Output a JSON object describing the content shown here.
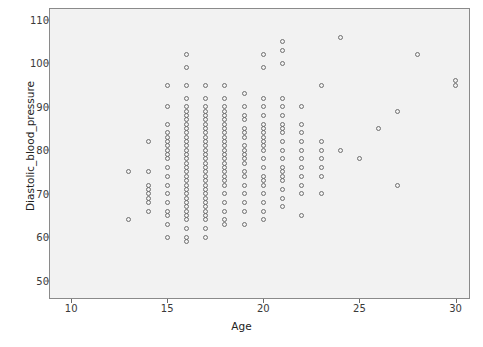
{
  "figure": {
    "clipped_header_text": "",
    "plot_area": {
      "x": 49,
      "y": 8,
      "width": 421,
      "height": 291
    },
    "colors": {
      "plot_background": "#f2f2f2",
      "frame": "#8a8a8a",
      "marker_stroke": "#6f6f6f",
      "tick": "#6a6a6a",
      "text": "#222222",
      "page_background": "#ffffff"
    }
  },
  "chart_data": {
    "type": "scatter",
    "title": "",
    "xlabel": "Age",
    "ylabel": "Diastolic_blood_pressure",
    "xlim": [
      8.9,
      30.7
    ],
    "ylim": [
      46.0,
      112.5
    ],
    "xticks": [
      10,
      15,
      20,
      25,
      30
    ],
    "yticks": [
      50,
      60,
      70,
      80,
      90,
      100,
      110
    ],
    "grid": false,
    "legend": null,
    "marker": {
      "shape": "circle-open",
      "size_px": 5
    },
    "points": [
      [
        13,
        75
      ],
      [
        13,
        64
      ],
      [
        14,
        82
      ],
      [
        14,
        75
      ],
      [
        14,
        72
      ],
      [
        14,
        71
      ],
      [
        14,
        70
      ],
      [
        14,
        69
      ],
      [
        14,
        68
      ],
      [
        14,
        66
      ],
      [
        15,
        95
      ],
      [
        15,
        90
      ],
      [
        15,
        86
      ],
      [
        15,
        84
      ],
      [
        15,
        83
      ],
      [
        15,
        82
      ],
      [
        15,
        81
      ],
      [
        15,
        80
      ],
      [
        15,
        79
      ],
      [
        15,
        78
      ],
      [
        15,
        76
      ],
      [
        15,
        74
      ],
      [
        15,
        72
      ],
      [
        15,
        70
      ],
      [
        15,
        68
      ],
      [
        15,
        66
      ],
      [
        15,
        65
      ],
      [
        15,
        63
      ],
      [
        15,
        60
      ],
      [
        16,
        102
      ],
      [
        16,
        99
      ],
      [
        16,
        95
      ],
      [
        16,
        92
      ],
      [
        16,
        90
      ],
      [
        16,
        89
      ],
      [
        16,
        88
      ],
      [
        16,
        87
      ],
      [
        16,
        86
      ],
      [
        16,
        85
      ],
      [
        16,
        84
      ],
      [
        16,
        83
      ],
      [
        16,
        82
      ],
      [
        16,
        81
      ],
      [
        16,
        80
      ],
      [
        16,
        79
      ],
      [
        16,
        78
      ],
      [
        16,
        77
      ],
      [
        16,
        76
      ],
      [
        16,
        75
      ],
      [
        16,
        74
      ],
      [
        16,
        73
      ],
      [
        16,
        72
      ],
      [
        16,
        71
      ],
      [
        16,
        70
      ],
      [
        16,
        69
      ],
      [
        16,
        68
      ],
      [
        16,
        67
      ],
      [
        16,
        66
      ],
      [
        16,
        65
      ],
      [
        16,
        64
      ],
      [
        16,
        62
      ],
      [
        16,
        60
      ],
      [
        16,
        59
      ],
      [
        17,
        95
      ],
      [
        17,
        92
      ],
      [
        17,
        90
      ],
      [
        17,
        89
      ],
      [
        17,
        88
      ],
      [
        17,
        87
      ],
      [
        17,
        86
      ],
      [
        17,
        85
      ],
      [
        17,
        84
      ],
      [
        17,
        83
      ],
      [
        17,
        82
      ],
      [
        17,
        81
      ],
      [
        17,
        80
      ],
      [
        17,
        79
      ],
      [
        17,
        78
      ],
      [
        17,
        77
      ],
      [
        17,
        76
      ],
      [
        17,
        75
      ],
      [
        17,
        74
      ],
      [
        17,
        73
      ],
      [
        17,
        72
      ],
      [
        17,
        71
      ],
      [
        17,
        70
      ],
      [
        17,
        69
      ],
      [
        17,
        68
      ],
      [
        17,
        67
      ],
      [
        17,
        66
      ],
      [
        17,
        65
      ],
      [
        17,
        64
      ],
      [
        17,
        62
      ],
      [
        17,
        60
      ],
      [
        18,
        95
      ],
      [
        18,
        92
      ],
      [
        18,
        90
      ],
      [
        18,
        89
      ],
      [
        18,
        88
      ],
      [
        18,
        87
      ],
      [
        18,
        86
      ],
      [
        18,
        85
      ],
      [
        18,
        84
      ],
      [
        18,
        83
      ],
      [
        18,
        82
      ],
      [
        18,
        81
      ],
      [
        18,
        80
      ],
      [
        18,
        79
      ],
      [
        18,
        78
      ],
      [
        18,
        77
      ],
      [
        18,
        76
      ],
      [
        18,
        75
      ],
      [
        18,
        74
      ],
      [
        18,
        73
      ],
      [
        18,
        72
      ],
      [
        18,
        70
      ],
      [
        18,
        68
      ],
      [
        18,
        66
      ],
      [
        18,
        64
      ],
      [
        18,
        63
      ],
      [
        19,
        93
      ],
      [
        19,
        90
      ],
      [
        19,
        88
      ],
      [
        19,
        87
      ],
      [
        19,
        85
      ],
      [
        19,
        84
      ],
      [
        19,
        83
      ],
      [
        19,
        81
      ],
      [
        19,
        80
      ],
      [
        19,
        79
      ],
      [
        19,
        78
      ],
      [
        19,
        77
      ],
      [
        19,
        75
      ],
      [
        19,
        74
      ],
      [
        19,
        72
      ],
      [
        19,
        70
      ],
      [
        19,
        68
      ],
      [
        19,
        66
      ],
      [
        19,
        63
      ],
      [
        20,
        102
      ],
      [
        20,
        99
      ],
      [
        20,
        92
      ],
      [
        20,
        90
      ],
      [
        20,
        88
      ],
      [
        20,
        86
      ],
      [
        20,
        85
      ],
      [
        20,
        84
      ],
      [
        20,
        83
      ],
      [
        20,
        82
      ],
      [
        20,
        81
      ],
      [
        20,
        80
      ],
      [
        20,
        78
      ],
      [
        20,
        76
      ],
      [
        20,
        74
      ],
      [
        20,
        73
      ],
      [
        20,
        72
      ],
      [
        20,
        70
      ],
      [
        20,
        68
      ],
      [
        20,
        66
      ],
      [
        20,
        64
      ],
      [
        21,
        105
      ],
      [
        21,
        103
      ],
      [
        21,
        100
      ],
      [
        21,
        92
      ],
      [
        21,
        90
      ],
      [
        21,
        88
      ],
      [
        21,
        86
      ],
      [
        21,
        85
      ],
      [
        21,
        84
      ],
      [
        21,
        82
      ],
      [
        21,
        80
      ],
      [
        21,
        78
      ],
      [
        21,
        76
      ],
      [
        21,
        75
      ],
      [
        21,
        74
      ],
      [
        21,
        73
      ],
      [
        21,
        71
      ],
      [
        21,
        69
      ],
      [
        21,
        67
      ],
      [
        22,
        90
      ],
      [
        22,
        86
      ],
      [
        22,
        84
      ],
      [
        22,
        82
      ],
      [
        22,
        80
      ],
      [
        22,
        78
      ],
      [
        22,
        76
      ],
      [
        22,
        74
      ],
      [
        22,
        72
      ],
      [
        22,
        70
      ],
      [
        22,
        65
      ],
      [
        23,
        95
      ],
      [
        23,
        82
      ],
      [
        23,
        80
      ],
      [
        23,
        78
      ],
      [
        23,
        76
      ],
      [
        23,
        74
      ],
      [
        23,
        70
      ],
      [
        24,
        106
      ],
      [
        24,
        80
      ],
      [
        25,
        78
      ],
      [
        26,
        85
      ],
      [
        27,
        89
      ],
      [
        27,
        72
      ],
      [
        28,
        102
      ],
      [
        30,
        96
      ],
      [
        30,
        95
      ]
    ]
  },
  "axes": {
    "y": {
      "label": "Diastolic_blood_pressure",
      "tick_labels": [
        "110",
        "100",
        "90",
        "80",
        "70",
        "60",
        "50"
      ],
      "tick_values": [
        110,
        100,
        90,
        80,
        70,
        60,
        50
      ]
    },
    "x": {
      "label": "Age",
      "tick_labels": [
        "10",
        "15",
        "20",
        "25",
        "30"
      ],
      "tick_values": [
        10,
        15,
        20,
        25,
        30
      ]
    }
  }
}
